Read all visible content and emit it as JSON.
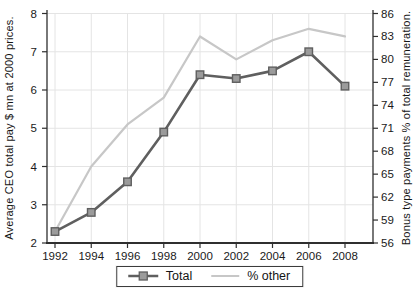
{
  "chart_data": {
    "type": "line",
    "x_labels": [
      "1992",
      "1994",
      "1996",
      "1998",
      "2000",
      "2002",
      "2004",
      "2006",
      "2008"
    ],
    "series": [
      {
        "name": "Total",
        "axis": "left",
        "color": "#5f5f5f",
        "marker": "square",
        "marker_fill": "#9b9b9b",
        "values": [
          2.3,
          2.8,
          3.6,
          4.9,
          6.4,
          6.3,
          6.5,
          7.0,
          6.1
        ]
      },
      {
        "name": "% other",
        "axis": "right",
        "color": "#c7c7c7",
        "marker": "none",
        "values": [
          57.5,
          66,
          71.5,
          75,
          83,
          80,
          82.5,
          84,
          83
        ]
      }
    ],
    "left_axis": {
      "label": "Average CEO total pay $ mn at 2000 prices.",
      "min": 2,
      "max": 8,
      "ticks": [
        2,
        3,
        4,
        5,
        6,
        7,
        8
      ]
    },
    "right_axis": {
      "label": "Bonus type payments % of total remuneration.",
      "min": 56,
      "max": 86,
      "ticks": [
        56,
        59,
        62,
        65,
        68,
        71,
        74,
        77,
        80,
        83,
        86
      ]
    },
    "legend": {
      "position": "bottom-center",
      "entries": [
        "Total",
        "% other"
      ]
    },
    "grid": true,
    "colors": {
      "grid": "#e4e4e4",
      "axis": "#2f2f2f",
      "text": "#1a1a1a",
      "background": "#ffffff"
    }
  }
}
